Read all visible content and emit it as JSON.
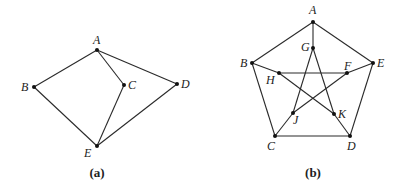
{
  "graphs": [
    {
      "id": "a",
      "caption": "(a)",
      "caption_pos": [
        97,
        177
      ],
      "vertices": [
        {
          "name": "A",
          "x": 97,
          "y": 50,
          "lx": 93,
          "ly": 44
        },
        {
          "name": "B",
          "x": 34,
          "y": 87,
          "lx": 21,
          "ly": 91
        },
        {
          "name": "C",
          "x": 124,
          "y": 85,
          "lx": 128,
          "ly": 89
        },
        {
          "name": "D",
          "x": 177,
          "y": 84,
          "lx": 181,
          "ly": 88
        },
        {
          "name": "E",
          "x": 97,
          "y": 146,
          "lx": 84,
          "ly": 157
        }
      ],
      "edges": [
        [
          "A",
          "B"
        ],
        [
          "A",
          "C"
        ],
        [
          "A",
          "D"
        ],
        [
          "B",
          "E"
        ],
        [
          "C",
          "E"
        ],
        [
          "D",
          "E"
        ]
      ]
    },
    {
      "id": "b",
      "caption": "(b)",
      "caption_pos": [
        313,
        177
      ],
      "vertices": [
        {
          "name": "A",
          "x": 313,
          "y": 22,
          "lx": 309,
          "ly": 14
        },
        {
          "name": "B",
          "x": 252,
          "y": 63,
          "lx": 240,
          "ly": 67
        },
        {
          "name": "C",
          "x": 275,
          "y": 136,
          "lx": 267,
          "ly": 150
        },
        {
          "name": "D",
          "x": 350,
          "y": 136,
          "lx": 347,
          "ly": 150
        },
        {
          "name": "E",
          "x": 373,
          "y": 63,
          "lx": 377,
          "ly": 67
        },
        {
          "name": "G",
          "x": 313,
          "y": 48,
          "lx": 301,
          "ly": 51
        },
        {
          "name": "H",
          "x": 279,
          "y": 73,
          "lx": 266,
          "ly": 84
        },
        {
          "name": "F",
          "x": 347,
          "y": 73,
          "lx": 344,
          "ly": 70
        },
        {
          "name": "J",
          "x": 293,
          "y": 113,
          "lx": 293,
          "ly": 124
        },
        {
          "name": "K",
          "x": 334,
          "y": 114,
          "lx": 338,
          "ly": 118
        }
      ],
      "edges": [
        [
          "A",
          "B"
        ],
        [
          "B",
          "C"
        ],
        [
          "C",
          "D"
        ],
        [
          "D",
          "E"
        ],
        [
          "E",
          "A"
        ],
        [
          "A",
          "G"
        ],
        [
          "B",
          "H"
        ],
        [
          "C",
          "J"
        ],
        [
          "D",
          "K"
        ],
        [
          "E",
          "F"
        ],
        [
          "G",
          "J"
        ],
        [
          "G",
          "K"
        ],
        [
          "H",
          "F"
        ],
        [
          "H",
          "K"
        ],
        [
          "J",
          "F"
        ]
      ]
    }
  ]
}
